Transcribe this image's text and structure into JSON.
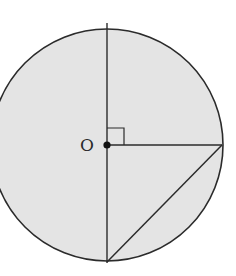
{
  "diagram": {
    "type": "geometry",
    "colors": {
      "background": "#ffffff",
      "circle_fill": "#e4e4e4",
      "stroke": "#2b2b2b",
      "center_point": "#111111"
    },
    "circle": {
      "cx": 107,
      "cy": 145,
      "r": 116
    },
    "center_label": "O",
    "elements": [
      {
        "name": "vertical-diameter",
        "from": [
          107,
          23
        ],
        "to": [
          107,
          263
        ]
      },
      {
        "name": "horizontal-radius",
        "from": [
          107,
          145
        ],
        "to": [
          222,
          145
        ]
      },
      {
        "name": "chord",
        "from": [
          222,
          145
        ],
        "to": [
          107,
          262
        ]
      }
    ],
    "right_angle_marker": {
      "at": "O",
      "size": 17
    }
  }
}
